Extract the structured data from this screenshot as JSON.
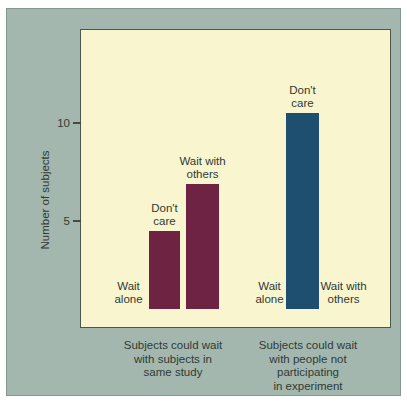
{
  "figure": {
    "page_background": "#ffffff",
    "panel_color": "#a3b7ae",
    "plot_background": "#f9f5cf",
    "plot_border_color": "#50554a",
    "text_color": "#303a35"
  },
  "chart_data": {
    "type": "bar",
    "title": "",
    "xlabel": "",
    "ylabel": "Number of subjects",
    "ylim": [
      0,
      15
    ],
    "grid": false,
    "legend": "none",
    "yticks": [
      {
        "value": 5,
        "label": "5"
      },
      {
        "value": 10,
        "label": "10"
      }
    ],
    "groups": [
      {
        "label": "Subjects could wait\nwith subjects in\nsame study",
        "color": "#6f2342",
        "bars": [
          {
            "category": "Wait alone",
            "label": "Wait\nalone",
            "value": 0
          },
          {
            "category": "Don't care",
            "label": "Don't\ncare",
            "value": 4
          },
          {
            "category": "Wait with others",
            "label": "Wait with\nothers",
            "value": 6.4
          }
        ]
      },
      {
        "label": "Subjects could wait\nwith people not\nparticipating\nin experiment",
        "color": "#1e4f70",
        "bars": [
          {
            "category": "Wait alone",
            "label": "Wait\nalone",
            "value": 0
          },
          {
            "category": "Don't care",
            "label": "Don't\ncare",
            "value": 10
          },
          {
            "category": "Wait with others",
            "label": "Wait with\nothers",
            "value": 0
          }
        ]
      }
    ]
  }
}
